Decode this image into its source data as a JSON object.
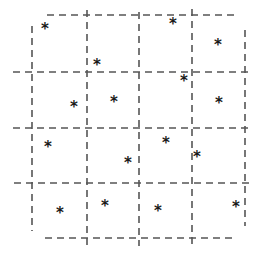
{
  "figure": {
    "width": 258,
    "height": 260,
    "background_color": "#ffffff"
  },
  "chart_data": {
    "type": "scatter",
    "title": "",
    "subtitle": "",
    "xlabel": "",
    "ylabel": "",
    "xlim": [
      0,
      258
    ],
    "ylim": [
      0,
      260
    ],
    "grid": true,
    "legend": null,
    "marker": {
      "symbol": "*",
      "name": "asterisk-marker",
      "color": "#1a1a1a",
      "size": 15
    },
    "point_count": 16,
    "points": [
      {
        "id": 1,
        "x": 45,
        "y": 29,
        "cell": "r1c1"
      },
      {
        "id": 2,
        "x": 173,
        "y": 24,
        "cell": "r1c4"
      },
      {
        "id": 3,
        "x": 218,
        "y": 45,
        "cell": "r1c5"
      },
      {
        "id": 4,
        "x": 97,
        "y": 65,
        "cell": "r1c3"
      },
      {
        "id": 5,
        "x": 184,
        "y": 81,
        "cell": "r2c4"
      },
      {
        "id": 6,
        "x": 74,
        "y": 107,
        "cell": "r2c2"
      },
      {
        "id": 7,
        "x": 114,
        "y": 102,
        "cell": "r2c3"
      },
      {
        "id": 8,
        "x": 219,
        "y": 103,
        "cell": "r2c5"
      },
      {
        "id": 9,
        "x": 48,
        "y": 147,
        "cell": "r3c1"
      },
      {
        "id": 10,
        "x": 166,
        "y": 143,
        "cell": "r3c4"
      },
      {
        "id": 11,
        "x": 128,
        "y": 163,
        "cell": "r3c3"
      },
      {
        "id": 12,
        "x": 197,
        "y": 157,
        "cell": "r3c5"
      },
      {
        "id": 13,
        "x": 60,
        "y": 213,
        "cell": "r4c1"
      },
      {
        "id": 14,
        "x": 105,
        "y": 206,
        "cell": "r4c2"
      },
      {
        "id": 15,
        "x": 158,
        "y": 211,
        "cell": "r4c3"
      },
      {
        "id": 16,
        "x": 236,
        "y": 207,
        "cell": "r4c5"
      }
    ],
    "grid_style": {
      "stroke_color": "#555555",
      "stroke_width": 1.6,
      "dash_pattern": "7,5"
    },
    "vertical_lines": [
      {
        "name": "vline-1",
        "x": 32,
        "y_start": 26,
        "y_end": 231
      },
      {
        "name": "vline-2",
        "x": 87,
        "y_start": 10,
        "y_end": 250
      },
      {
        "name": "vline-3",
        "x": 139,
        "y_start": 12,
        "y_end": 246
      },
      {
        "name": "vline-4",
        "x": 192,
        "y_start": 9,
        "y_end": 246
      },
      {
        "name": "vline-5",
        "x": 245,
        "y_start": 30,
        "y_end": 226
      }
    ],
    "horizontal_lines": [
      {
        "name": "hline-1",
        "y": 15,
        "x_start": 47,
        "x_end": 234
      },
      {
        "name": "hline-2",
        "y": 72,
        "x_start": 13,
        "x_end": 251
      },
      {
        "name": "hline-3",
        "y": 128,
        "x_start": 13,
        "x_end": 251
      },
      {
        "name": "hline-4",
        "y": 183,
        "x_start": 14,
        "x_end": 250
      },
      {
        "name": "hline-5",
        "y": 238,
        "x_start": 45,
        "x_end": 233
      }
    ]
  }
}
